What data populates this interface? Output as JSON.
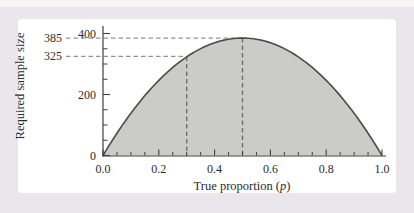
{
  "figure": {
    "frame_bg": "#e9e7ec",
    "top_strip_bg": "#f5f3f5",
    "panel_bg": "#ffffff"
  },
  "chart_data": {
    "type": "area",
    "title": "",
    "xlabel": "True proportion (p)",
    "xlabel_parts": {
      "prefix": "True proportion (",
      "var": "p",
      "suffix": ")"
    },
    "ylabel": "Required sample size",
    "x_axis": {
      "range": [
        0.0,
        1.0
      ],
      "ticks": [
        {
          "v": 0.0,
          "label": "0.0"
        },
        {
          "v": 0.2,
          "label": "0.2"
        },
        {
          "v": 0.4,
          "label": "0.4"
        },
        {
          "v": 0.6,
          "label": "0.6"
        },
        {
          "v": 0.8,
          "label": "0.8"
        },
        {
          "v": 1.0,
          "label": "1.0"
        }
      ],
      "minor_step": 0.05,
      "grid": false
    },
    "y_axis": {
      "range": [
        0,
        400
      ],
      "ticks": [
        {
          "v": 0,
          "label": "0"
        },
        {
          "v": 200,
          "label": "200"
        },
        {
          "v": 400,
          "label": "400"
        }
      ],
      "minor_step": 50,
      "grid": false
    },
    "curve": {
      "formula": "n = 4 * n_max * p * (1 - p)",
      "n_max": 385,
      "points": [
        [
          0.0,
          0
        ],
        [
          0.1,
          139
        ],
        [
          0.2,
          246
        ],
        [
          0.3,
          323
        ],
        [
          0.4,
          370
        ],
        [
          0.5,
          385
        ],
        [
          0.6,
          370
        ],
        [
          0.7,
          323
        ],
        [
          0.8,
          246
        ],
        [
          0.9,
          139
        ],
        [
          1.0,
          0
        ]
      ]
    },
    "annotations": [
      {
        "p": 0.3,
        "n": 325,
        "label": "325"
      },
      {
        "p": 0.5,
        "n": 385,
        "label": "385"
      }
    ],
    "legend": null,
    "colors": {
      "fill": "#cbcbca",
      "stroke": "#4d4a47",
      "dash_h": "#949494",
      "dash_v": "#6f6f6f",
      "axis": "#3f3f3f",
      "text": "#2e2c2a"
    }
  }
}
